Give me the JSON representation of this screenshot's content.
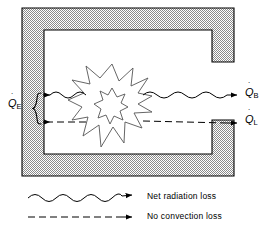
{
  "figure": {
    "background_color": "#ffffff",
    "line_color": "#000000",
    "wall_fill_color": "#b3b3b3",
    "wall_stroke_color": "#000000"
  },
  "enclosure": {
    "name": "c-shaped-enclosure",
    "description": "C-shaped hatched enclosure wall open on the right side",
    "outer": {
      "x": 22,
      "y": 8,
      "width": 212,
      "height": 168
    },
    "wall_thickness": 22,
    "opening_side": "right",
    "opening_top_y": 62,
    "opening_bottom_y": 120
  },
  "flame": {
    "name": "explosion-burst",
    "description": "Jagged starburst representing the combustion / heat source",
    "center_x": 112,
    "center_y": 104,
    "outer_radius": 40,
    "inner_radius": 13,
    "points": 13
  },
  "arrows": {
    "radiation": {
      "label": "Q_B",
      "label_main": "Q",
      "label_dot": "˙",
      "label_sub": "B",
      "style": "wavy",
      "y": 95,
      "x_start": 44,
      "x_end": 238,
      "direction": "bidirectional-outward"
    },
    "convection": {
      "label": "Q_L",
      "label_main": "Q",
      "label_dot": "˙",
      "label_sub": "L",
      "style": "dashed",
      "y": 122,
      "x_start": 44,
      "x_end": 238,
      "direction": "bidirectional-outward"
    },
    "incoming": {
      "label": "Q_E",
      "label_main": "Q",
      "label_dot": "˙",
      "label_sub": "E",
      "brace_top_y": 95,
      "brace_bottom_y": 122,
      "brace_x": 36
    }
  },
  "legend": {
    "items": [
      {
        "id": "legend-radiation",
        "style": "wavy",
        "label": "Net radiation loss",
        "y": 197
      },
      {
        "id": "legend-convection",
        "style": "dashed",
        "label": "No convection loss",
        "y": 216
      }
    ],
    "sample_x_start": 28,
    "sample_x_end": 128,
    "text_x": 147
  }
}
